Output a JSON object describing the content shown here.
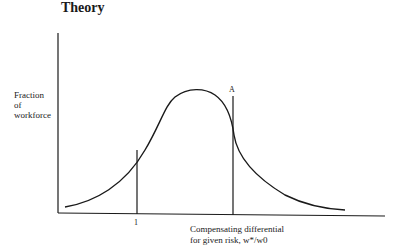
{
  "header": {
    "title": "Theory"
  },
  "diagram": {
    "y_axis_label": [
      "Fraction",
      "of",
      "workforce"
    ],
    "x_axis_label": [
      "Compensating differential",
      "for given risk, w*/w0"
    ],
    "tick_label": "1",
    "marker_label": "A"
  }
}
